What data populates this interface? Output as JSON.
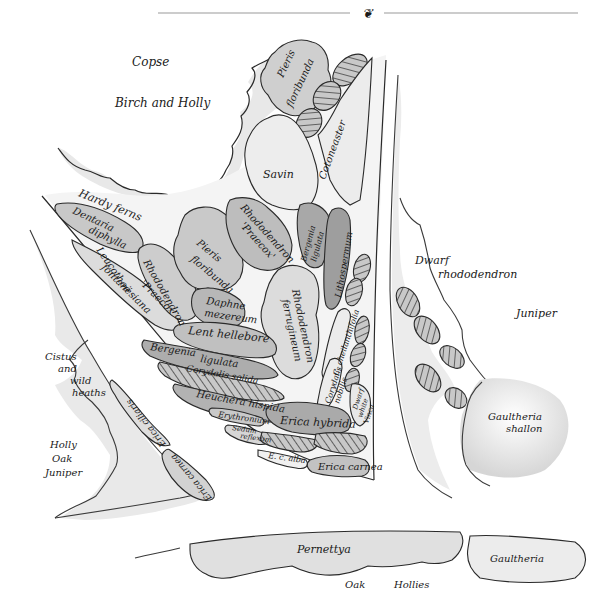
{
  "header": {
    "ornament": "❦",
    "rule_color": "#999999"
  },
  "colors": {
    "background": "#ffffff",
    "ink": "#1a1a1a",
    "wash_light": "#e6e6e6",
    "wash_mid": "#cfcfcf",
    "wash_dark": "#b4b4b4",
    "wash_darker": "#9a9a9a",
    "hatch": "#555555"
  },
  "areas": {
    "copse": "Copse",
    "birch_holly": "Birch and Holly",
    "hardy_ferns": "Hardy ferns",
    "cistus_1": "Cistus",
    "cistus_2": "and",
    "cistus_3": "wild",
    "cistus_4": "heaths",
    "holly_1": "Holly",
    "holly_2": "Oak",
    "holly_3": "Juniper",
    "dwarf_1": "Dwarf",
    "dwarf_2": "rhododendron",
    "juniper": "Juniper",
    "gaultheria_shallon_1": "Gaultheria",
    "gaultheria_shallon_2": "shallon",
    "pernettya": "Pernettya",
    "oak": "Oak",
    "hollies": "Hollies",
    "gaultheria": "Gaultheria"
  },
  "beds": {
    "pieris_top_1": "Pieris",
    "pieris_top_2": "floribunda",
    "cotoneaster": "Cotoneaster",
    "savin": "Savin",
    "dentaria_1": "Dentaria",
    "dentaria_2": "diphylla",
    "leucothoe_1": "Leucothoë",
    "leucothoe_2": "fontanesiana",
    "rhodo_praecox_left_1": "Rhododendron",
    "rhodo_praecox_left_2": "'Praecox'",
    "pieris_mid_1": "Pieris",
    "pieris_mid_2": "floribunda",
    "rhodo_praecox_right_1": "Rhododendron",
    "rhodo_praecox_right_2": "'Praecox'",
    "bergenia_ligulata_1": "Bergenia",
    "bergenia_ligulata_2": "ligulata",
    "lithospermum": "Lithospermum",
    "daphne_1": "Daphne",
    "daphne_2": "mezereum",
    "rhodo_ferrugineum_1": "Rhododendron",
    "rhodo_ferrugineum_2": "ferrugineum",
    "lent_hellebore": "Lent hellebore",
    "bergenia_1": "Bergenia",
    "bergenia_2": "ligulata",
    "corydalis_solida": "Corydalis solida",
    "heuchera": "Heuchera hispida",
    "erythronium": "Erythronium",
    "sedum_1": "Sedum",
    "sedum_2": "reflexum",
    "c_cheilanthifolia": "C. cheilanthifolia",
    "corydalis_nobilis_1": "Corydalis",
    "corydalis_nobilis_2": "nobilis",
    "dwarf_vinca_1": "Dwarf",
    "dwarf_vinca_2": "white",
    "dwarf_vinca_3": "Vinca",
    "erica_hybrida": "Erica hybrida",
    "ec_alba": "E. c. alba",
    "erica_carnea_right": "Erica carnea",
    "erica_ciliaris": "Erica ciliaris",
    "erica_carnea_left": "Erica carnea"
  }
}
